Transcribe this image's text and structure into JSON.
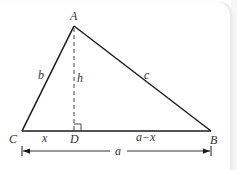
{
  "diagram": {
    "vertices": {
      "A": {
        "label": "A",
        "x": 74,
        "y": 26
      },
      "B": {
        "label": "B",
        "x": 211,
        "y": 131
      },
      "C": {
        "label": "C",
        "x": 22,
        "y": 131
      },
      "D": {
        "label": "D",
        "x": 74,
        "y": 131
      }
    },
    "sides": {
      "b": "b",
      "c": "c",
      "h": "h",
      "x": "x",
      "a_minus_x": "a−x",
      "a": "a"
    },
    "colors": {
      "line": "#1a1a1a",
      "label": "#333333",
      "dashed": "#555555"
    }
  }
}
